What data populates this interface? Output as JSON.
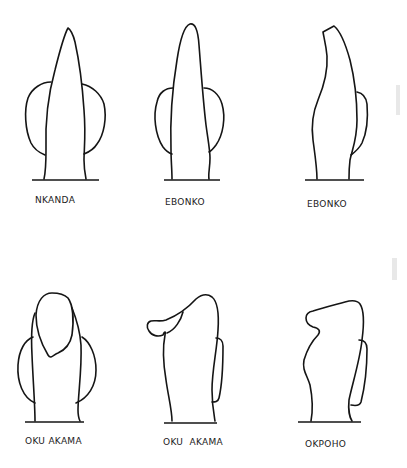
{
  "figure": {
    "ink_color": "#151515",
    "background": "#ffffff",
    "rows": [
      {
        "items": [
          {
            "id": "fig-1",
            "label": "NKANDA",
            "view": "front"
          },
          {
            "id": "fig-2",
            "label": "EBONKO",
            "view": "front"
          },
          {
            "id": "fig-3",
            "label": "EBONKO",
            "view": "side"
          }
        ]
      },
      {
        "items": [
          {
            "id": "fig-4",
            "label": "OKU AKAMA",
            "view": "front"
          },
          {
            "id": "fig-5",
            "label": "OKU  AKAMA",
            "view": "side"
          },
          {
            "id": "fig-6",
            "label": "OKPOHO",
            "view": "side"
          }
        ]
      }
    ]
  }
}
